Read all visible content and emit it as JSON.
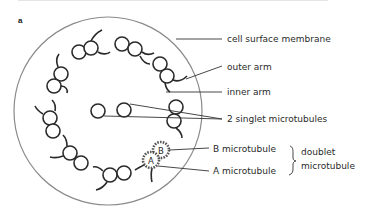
{
  "figure": {
    "panel_letter": "a",
    "labels": {
      "cell_surface_membrane": "cell surface membrane",
      "outer_arm": "outer arm",
      "inner_arm": "inner arm",
      "singlet": "2 singlet microtubules",
      "b_microtubule": "B microtubule",
      "a_microtubule": "A microtubule",
      "doublet_line1": "doublet",
      "doublet_line2": "microtubule"
    },
    "tubule_letters": {
      "a": "A",
      "b": "B"
    },
    "colors": {
      "membrane": "#8a8a8a",
      "tubule": "#2a2a2a",
      "leader": "#333333",
      "text": "#2a2a2a"
    }
  }
}
